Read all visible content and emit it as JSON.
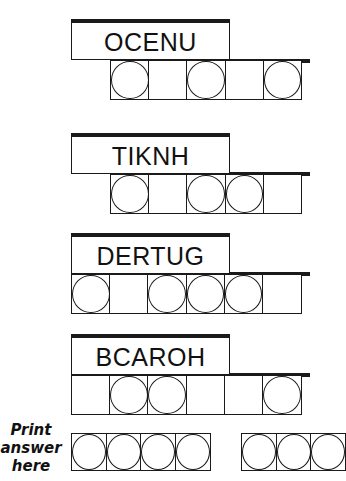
{
  "puzzles": [
    {
      "scrambled": "OCENU",
      "cells": [
        true,
        false,
        true,
        false,
        true
      ]
    },
    {
      "scrambled": "TIKNH",
      "cells": [
        true,
        false,
        true,
        true,
        false
      ]
    },
    {
      "scrambled": "DERTUG",
      "cells": [
        true,
        false,
        true,
        true,
        true,
        false
      ]
    },
    {
      "scrambled": "BCAROH",
      "cells": [
        false,
        true,
        true,
        false,
        false,
        true
      ]
    }
  ],
  "answer": {
    "label_line1": "Print",
    "label_line2": "answer",
    "label_line3": "here",
    "group1_cells": 4,
    "group2_cells_visible": 3
  },
  "colors": {
    "ink": "#1a1a1a",
    "background": "#ffffff"
  }
}
